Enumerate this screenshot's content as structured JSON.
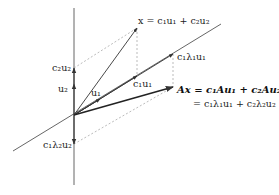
{
  "diagram": {
    "colors": {
      "axis": "#555555",
      "vector": "#333333",
      "ax_vector": "#222222",
      "dashed": "#aaaaaa",
      "text": "#222222"
    },
    "labels": {
      "x_eq": "x = c₁u₁ + c₂u₂",
      "c1_lambda1_u1": "c₁λ₁u₁",
      "c1_u1": "c₁u₁",
      "c2_u2": "c₂u₂",
      "u2": "u₂",
      "u1": "u₁",
      "ax_line1": "Ax = c₁Au₁ + c₂Au₂",
      "ax_line2": "= c₁λ₁u₁ + c₂λ₂u₂",
      "c1_lambda2_u2": "c₁λ₂u₂"
    }
  }
}
